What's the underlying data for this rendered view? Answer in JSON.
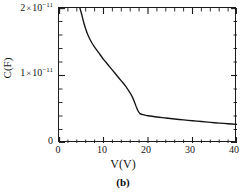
{
  "figure": {
    "caption": "(b)",
    "background_color": "#ffffff",
    "line_color": "#141414",
    "axis_color": "#1a1a1a"
  },
  "axes": {
    "x_title": "V(V)",
    "y_title": "C(F)",
    "x_ticks": [
      "0",
      "10",
      "20",
      "30",
      "40"
    ],
    "y_tick_zero": "0",
    "y_tick_mid_mantissa": "1",
    "y_tick_mid_times": "×",
    "y_tick_mid_base": "10",
    "y_tick_mid_exponent": "−11",
    "y_tick_top_mantissa": "2",
    "y_tick_top_times": "×",
    "y_tick_top_base": "10",
    "y_tick_top_exponent": "−11"
  },
  "chart_data": {
    "type": "line",
    "title": "",
    "subtitle": "",
    "xlabel": "V(V)",
    "ylabel": "C(F)",
    "xlim": [
      0,
      40
    ],
    "ylim": [
      0,
      2e-11
    ],
    "xticks": [
      0,
      10,
      20,
      30,
      40
    ],
    "xticks_minor_step": 2,
    "yticks": [
      0,
      1e-11,
      2e-11
    ],
    "yticks_minor_step": 2e-12,
    "ytick_labels": [
      "0",
      "1 × 10⁻¹¹",
      "2 × 10⁻¹¹"
    ],
    "grid": false,
    "legend": null,
    "annotations": [
      "(b)"
    ],
    "series": [
      {
        "name": "C-V curve",
        "color": "#141414",
        "x": [
          4.6,
          5.0,
          5.5,
          6.0,
          6.5,
          7.0,
          7.5,
          8.0,
          9.0,
          10.0,
          11.0,
          12.0,
          13.0,
          14.0,
          15.0,
          16.0,
          16.5,
          17.0,
          17.4,
          17.8,
          18.2,
          18.8,
          19.5,
          20.5,
          22.0,
          24.0,
          26.0,
          28.0,
          30.0,
          32.0,
          34.0,
          36.0,
          38.0,
          40.0
        ],
        "y": [
          2.02e-11,
          1.93e-11,
          1.8e-11,
          1.69e-11,
          1.6e-11,
          1.53e-11,
          1.47e-11,
          1.42e-11,
          1.33e-11,
          1.24e-11,
          1.16e-11,
          1.08e-11,
          1e-11,
          9.2e-12,
          8.4e-12,
          7.4e-12,
          6.8e-12,
          6e-12,
          5.3e-12,
          4.7e-12,
          4.35e-12,
          4.2e-12,
          4.1e-12,
          4e-12,
          3.85e-12,
          3.7e-12,
          3.55e-12,
          3.42e-12,
          3.3e-12,
          3.18e-12,
          3.06e-12,
          2.95e-12,
          2.85e-12,
          2.75e-12
        ]
      }
    ]
  }
}
